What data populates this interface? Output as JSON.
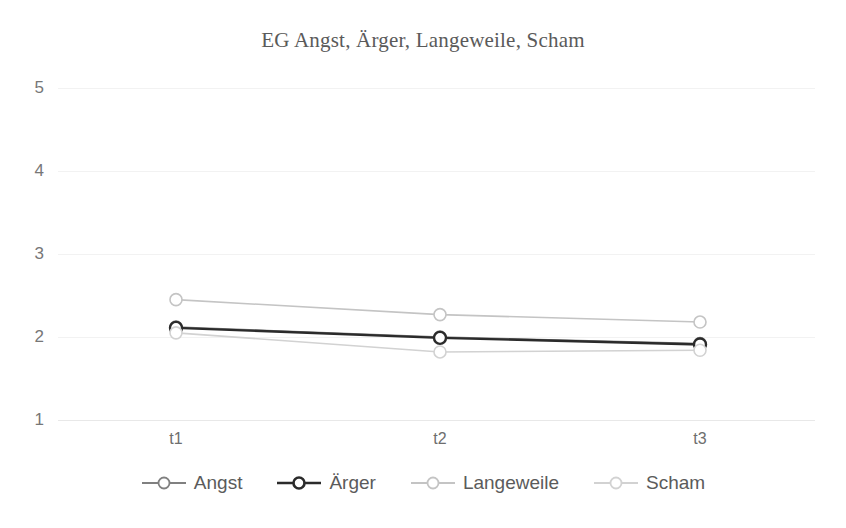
{
  "chart_data": {
    "type": "line",
    "title": "EG Angst, Ärger, Langeweile, Scham",
    "xlabel": "",
    "ylabel": "",
    "categories": [
      "t1",
      "t2",
      "t3"
    ],
    "ylim": [
      1,
      5
    ],
    "yticks": [
      1,
      2,
      3,
      4,
      5
    ],
    "ytick_labels": [
      "1",
      "2",
      "3",
      "4",
      "5"
    ],
    "grid": true,
    "legend_position": "bottom",
    "marker": "open-circle",
    "series": [
      {
        "name": "Angst",
        "values": [
          2.12,
          2.0,
          1.92
        ],
        "color": "#808080"
      },
      {
        "name": "Ärger",
        "values": [
          2.11,
          1.99,
          1.91
        ],
        "color": "#2b2b2b"
      },
      {
        "name": "Langeweile",
        "values": [
          2.45,
          2.27,
          2.18
        ],
        "color": "#c4c4c4"
      },
      {
        "name": "Scham",
        "values": [
          2.05,
          1.82,
          1.84
        ],
        "color": "#d2d2d2"
      }
    ]
  },
  "legend": {
    "items": [
      {
        "label": "Angst"
      },
      {
        "label": "Ärger"
      },
      {
        "label": "Langeweile"
      },
      {
        "label": "Scham"
      }
    ]
  },
  "axis": {
    "y_labels": [
      "5",
      "4",
      "3",
      "2",
      "1"
    ],
    "x_labels": [
      "t1",
      "t2",
      "t3"
    ]
  },
  "colors": {
    "background": "#ffffff",
    "grid": "#f2f2f2",
    "title_text": "#5a5a5a",
    "tick_text": "#777777",
    "legend_text": "#5b5b5b"
  }
}
